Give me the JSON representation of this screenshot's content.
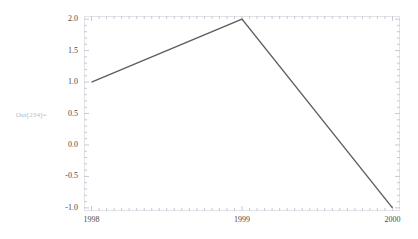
{
  "cell": {
    "out_label": "Out[234]="
  },
  "chart_data": {
    "type": "line",
    "title": "",
    "xlabel": "",
    "ylabel": "",
    "x": [
      1998,
      1999,
      2000
    ],
    "values": [
      1.0,
      2.0,
      -1.0
    ],
    "series": [
      {
        "name": "series-1",
        "values": [
          1.0,
          2.0,
          -1.0
        ]
      }
    ],
    "xlim": [
      1997.95,
      2000.05
    ],
    "ylim": [
      -1.05,
      2.05
    ],
    "xticks": [
      1998,
      1999,
      2000
    ],
    "xtick_labels": [
      "1998",
      "1999",
      "2000"
    ],
    "yticks": [
      2.0,
      1.5,
      1.0,
      0.5,
      0.0,
      -0.5,
      -1.0
    ],
    "ytick_labels": [
      "2.0",
      "1.5",
      "1.0",
      "0.5",
      "0.0",
      "-0.5",
      "-1.0"
    ],
    "grid": false,
    "frame": true,
    "minor_ticks": true,
    "legend": null,
    "line_color": "#5f5f5f",
    "frame_color": "#e2e2e8",
    "tick_color": "#c9c9d2",
    "label_color": "#4a4a4a",
    "background": "#ffffff"
  }
}
